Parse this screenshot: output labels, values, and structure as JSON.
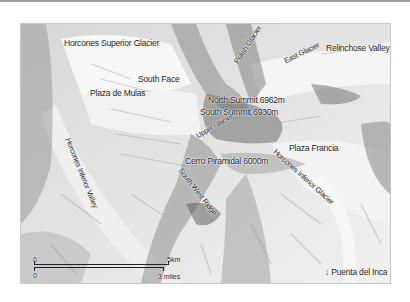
{
  "map": {
    "title": "Aconcagua route map",
    "labels": {
      "horcones_superior_glacier": "Horcones Superior Glacier",
      "south_face": "South Face",
      "plaza_de_mulas": "Plaza de Mulas",
      "polish_glacier": "Polish Glacier",
      "east_glacier": "East Glacier",
      "relinchose_valley": "Relinchose Valley →",
      "north_summit": "North Summit 6962m",
      "south_summit": "South Summit 6930m",
      "upper_glacier": "Upper Glacier",
      "plaza_francia": "Plaza Francia",
      "horcones_inferior_glacier": "Horcones Inferior Glacier",
      "cerro_piramidal": "Cerro Piramidal 6000m",
      "south_west_ridge": "South West Ridge",
      "horcones_inferior_valley": "Horcones Inferior Valley",
      "puenta_del_inca": "↓ Puenta del Inca"
    },
    "scale": {
      "km_zero": "0",
      "km_max": "5km",
      "mi_zero": "0",
      "mi_max": "3 miles"
    },
    "colors": {
      "border": "#c8c8c8",
      "text": "#1a1a1a",
      "terrain_light": "#f4f4f4",
      "terrain_mid": "#b8b8b8",
      "terrain_dark": "#5a5a5a"
    }
  }
}
